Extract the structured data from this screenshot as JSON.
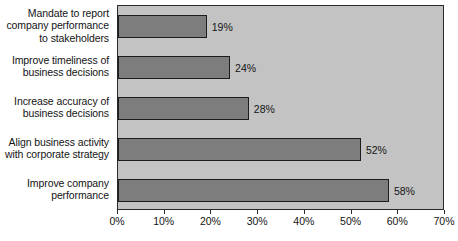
{
  "chart_data": {
    "type": "bar",
    "orientation": "horizontal",
    "title": "",
    "xlabel": "",
    "ylabel": "",
    "xlim": [
      0,
      70
    ],
    "grid": false,
    "legend": false,
    "categories": [
      "Mandate to report company performance to stakeholders",
      "Improve timeliness of business decisions",
      "Increase accuracy of business decisions",
      "Align business activity with corporate strategy",
      "Improve company performance"
    ],
    "category_lines": [
      [
        "Mandate to report",
        "company performance",
        "to stakeholders"
      ],
      [
        "Improve timeliness of",
        "business decisions"
      ],
      [
        "Increase accuracy of",
        "business decisions"
      ],
      [
        "Align business activity",
        "with corporate strategy"
      ],
      [
        "Improve company",
        "performance"
      ]
    ],
    "values": [
      19,
      24,
      28,
      52,
      58
    ],
    "value_labels": [
      "19%",
      "24%",
      "28%",
      "52%",
      "58%"
    ],
    "xticks": [
      0,
      10,
      20,
      30,
      40,
      50,
      60,
      70
    ],
    "xtick_labels": [
      "0%",
      "10%",
      "20%",
      "30%",
      "40%",
      "50%",
      "60%",
      "70%"
    ],
    "colors": {
      "bar_fill": "#7d7d7d",
      "bar_border": "#1c1c1c",
      "plot_background": "#c3c3c3",
      "plot_border": "#2a2a2a",
      "text": "#141414",
      "page_background": "#ffffff"
    }
  }
}
